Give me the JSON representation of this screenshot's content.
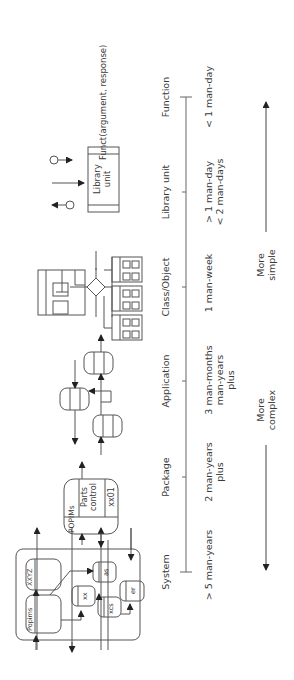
{
  "levels": [
    {
      "name": "System",
      "effort": "> 5 man-years"
    },
    {
      "name": "Package",
      "effort": "2 man-years\nplus"
    },
    {
      "name": "Application",
      "effort": "3 man-months\nman-years\nplus"
    },
    {
      "name": "Class/Object",
      "effort": "1 man-week"
    },
    {
      "name": "Library unit",
      "effort": "> 1 man-day\n< 2 man-days"
    },
    {
      "name": "Function",
      "effort": "< 1 man-day"
    }
  ],
  "system_diagram": {
    "modules": [
      "Popims",
      "XXYZ",
      "xx",
      "as",
      "xcs",
      "er"
    ]
  },
  "package_diagram": {
    "cells": [
      "POPIMs",
      "Parts\ncontrol",
      "xx01"
    ]
  },
  "library_diagram": {
    "label": "Library\nunit"
  },
  "function_diagram": {
    "label": "Funct(argument, response)"
  },
  "complexity": {
    "complex_label": "More\ncomplex",
    "simple_label": "More\nsimple"
  },
  "colors": {
    "line": "#555555",
    "text": "#3a3a3a",
    "background": "#ffffff"
  }
}
